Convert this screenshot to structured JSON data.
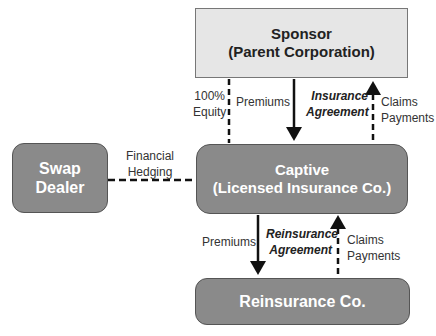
{
  "nodes": {
    "sponsor": {
      "line1": "Sponsor",
      "line2": "(Parent Corporation)"
    },
    "captive": {
      "line1": "Captive",
      "line2": "(Licensed Insurance Co.)"
    },
    "swap_dealer": {
      "line1": "Swap",
      "line2": "Dealer"
    },
    "reinsurance": {
      "line1": "Reinsurance Co."
    }
  },
  "edges": {
    "equity": {
      "line1": "100%",
      "line2": "Equity"
    },
    "premiums_top": {
      "line1": "Premiums"
    },
    "insurance_agreement": {
      "line1": "Insurance",
      "line2": "Agreement"
    },
    "claims_top": {
      "line1": "Claims",
      "line2": "Payments"
    },
    "hedging": {
      "line1": "Financial",
      "line2": "Hedging"
    },
    "premiums_bottom": {
      "line1": "Premiums"
    },
    "reinsurance_agreement": {
      "line1": "Reinsurance",
      "line2": "Agreement"
    },
    "claims_bottom": {
      "line1": "Claims",
      "line2": "Payments"
    }
  },
  "colors": {
    "box_dark": "#8a8a8a",
    "box_light": "#e6e6e6",
    "line": "#111111"
  }
}
